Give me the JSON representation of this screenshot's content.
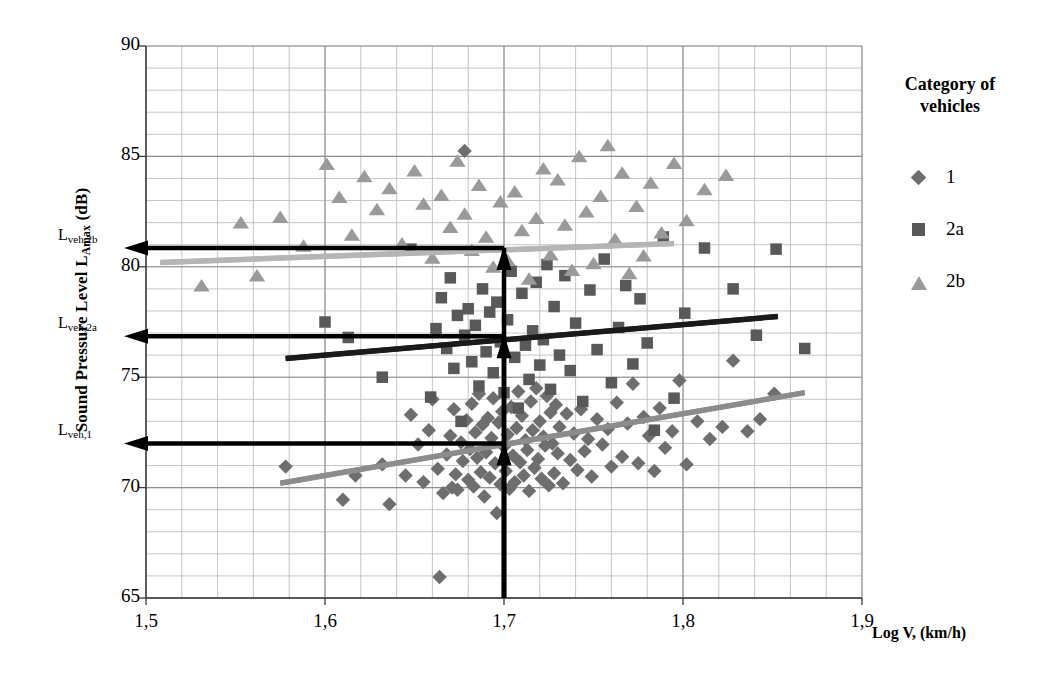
{
  "chart_data": {
    "type": "scatter",
    "title": "",
    "xlabel": "Log V, (km/h)",
    "ylabel": "Sound Pressure Level L_Amax (dB)",
    "ylabel_main": "Sound Pressure Level L",
    "ylabel_sub": "Amax",
    "ylabel_unit": " (dB)",
    "xlim": [
      1.5,
      1.9
    ],
    "ylim": [
      65,
      90
    ],
    "x_ticks": [
      "1,5",
      "1,6",
      "1,7",
      "1,8",
      "1,9"
    ],
    "x_tick_values": [
      1.5,
      1.6,
      1.7,
      1.8,
      1.9
    ],
    "y_ticks": [
      "65",
      "70",
      "75",
      "80",
      "85",
      "90"
    ],
    "y_tick_values": [
      65,
      70,
      75,
      80,
      85,
      90
    ],
    "grid": "major and minor, minor every 0.02 in x and 1 dB in y",
    "legend_position": "right",
    "legend_title_line1": "Category of",
    "legend_title_line2": "vehicles",
    "series": [
      {
        "name": "1",
        "marker": "diamond",
        "color": "#6e6e6e",
        "trend_color": "#8c8c8c",
        "trendline": {
          "x0": 1.575,
          "y0": 70.2,
          "x1": 1.868,
          "y1": 74.3
        },
        "points": [
          [
            1.578,
            70.95
          ],
          [
            1.61,
            69.45
          ],
          [
            1.617,
            70.55
          ],
          [
            1.632,
            71.05
          ],
          [
            1.636,
            69.25
          ],
          [
            1.645,
            70.55
          ],
          [
            1.648,
            73.3
          ],
          [
            1.652,
            71.95
          ],
          [
            1.655,
            70.25
          ],
          [
            1.658,
            72.6
          ],
          [
            1.66,
            74.0
          ],
          [
            1.663,
            70.85
          ],
          [
            1.664,
            65.95
          ],
          [
            1.666,
            69.75
          ],
          [
            1.668,
            71.5
          ],
          [
            1.67,
            72.35
          ],
          [
            1.671,
            70.0
          ],
          [
            1.672,
            73.55
          ],
          [
            1.673,
            70.6
          ],
          [
            1.674,
            69.9
          ],
          [
            1.676,
            72.05
          ],
          [
            1.677,
            71.2
          ],
          [
            1.678,
            85.25
          ],
          [
            1.679,
            73.05
          ],
          [
            1.68,
            70.35
          ],
          [
            1.681,
            71.75
          ],
          [
            1.682,
            73.8
          ],
          [
            1.683,
            70.05
          ],
          [
            1.684,
            72.5
          ],
          [
            1.685,
            71.35
          ],
          [
            1.686,
            74.25
          ],
          [
            1.687,
            70.7
          ],
          [
            1.688,
            72.85
          ],
          [
            1.689,
            69.6
          ],
          [
            1.69,
            71.6
          ],
          [
            1.691,
            73.15
          ],
          [
            1.692,
            70.45
          ],
          [
            1.693,
            72.25
          ],
          [
            1.694,
            74.05
          ],
          [
            1.695,
            71.1
          ],
          [
            1.696,
            68.85
          ],
          [
            1.697,
            72.95
          ],
          [
            1.698,
            70.15
          ],
          [
            1.699,
            73.45
          ],
          [
            1.7,
            71.85
          ],
          [
            1.701,
            70.75
          ],
          [
            1.702,
            72.4
          ],
          [
            1.703,
            69.95
          ],
          [
            1.704,
            73.65
          ],
          [
            1.705,
            71.45
          ],
          [
            1.706,
            70.25
          ],
          [
            1.707,
            72.7
          ],
          [
            1.708,
            74.35
          ],
          [
            1.709,
            71.15
          ],
          [
            1.71,
            73.25
          ],
          [
            1.711,
            70.55
          ],
          [
            1.712,
            72.15
          ],
          [
            1.713,
            71.7
          ],
          [
            1.714,
            69.85
          ],
          [
            1.715,
            73.9
          ],
          [
            1.716,
            72.6
          ],
          [
            1.717,
            70.9
          ],
          [
            1.718,
            74.5
          ],
          [
            1.719,
            71.3
          ],
          [
            1.72,
            73.0
          ],
          [
            1.721,
            70.4
          ],
          [
            1.722,
            72.3
          ],
          [
            1.723,
            71.9
          ],
          [
            1.724,
            74.15
          ],
          [
            1.725,
            70.1
          ],
          [
            1.726,
            73.4
          ],
          [
            1.727,
            72.0
          ],
          [
            1.728,
            70.65
          ],
          [
            1.729,
            73.75
          ],
          [
            1.73,
            71.55
          ],
          [
            1.731,
            72.75
          ],
          [
            1.733,
            70.2
          ],
          [
            1.735,
            73.35
          ],
          [
            1.737,
            71.25
          ],
          [
            1.739,
            72.45
          ],
          [
            1.741,
            70.8
          ],
          [
            1.743,
            73.55
          ],
          [
            1.745,
            71.65
          ],
          [
            1.747,
            72.2
          ],
          [
            1.749,
            70.5
          ],
          [
            1.752,
            73.1
          ],
          [
            1.755,
            71.95
          ],
          [
            1.758,
            72.65
          ],
          [
            1.76,
            70.95
          ],
          [
            1.763,
            73.85
          ],
          [
            1.766,
            71.4
          ],
          [
            1.769,
            72.9
          ],
          [
            1.772,
            74.7
          ],
          [
            1.775,
            71.1
          ],
          [
            1.778,
            73.2
          ],
          [
            1.781,
            72.35
          ],
          [
            1.784,
            70.75
          ],
          [
            1.787,
            73.6
          ],
          [
            1.79,
            71.8
          ],
          [
            1.794,
            72.55
          ],
          [
            1.798,
            74.85
          ],
          [
            1.802,
            71.05
          ],
          [
            1.808,
            73.0
          ],
          [
            1.815,
            72.2
          ],
          [
            1.822,
            72.75
          ],
          [
            1.828,
            75.75
          ],
          [
            1.836,
            72.55
          ],
          [
            1.843,
            73.1
          ],
          [
            1.851,
            74.25
          ]
        ]
      },
      {
        "name": "2a",
        "marker": "square",
        "color": "#595959",
        "trend_color": "#1a1a1a",
        "trendline": {
          "x0": 1.578,
          "y0": 75.85,
          "x1": 1.853,
          "y1": 77.75
        },
        "points": [
          [
            1.6,
            77.5
          ],
          [
            1.613,
            76.8
          ],
          [
            1.632,
            75.0
          ],
          [
            1.648,
            80.8
          ],
          [
            1.659,
            74.1
          ],
          [
            1.662,
            77.2
          ],
          [
            1.665,
            78.6
          ],
          [
            1.668,
            76.3
          ],
          [
            1.67,
            79.5
          ],
          [
            1.672,
            75.4
          ],
          [
            1.674,
            77.8
          ],
          [
            1.676,
            73.0
          ],
          [
            1.678,
            76.9
          ],
          [
            1.68,
            78.1
          ],
          [
            1.682,
            75.7
          ],
          [
            1.684,
            77.35
          ],
          [
            1.686,
            74.6
          ],
          [
            1.688,
            79.0
          ],
          [
            1.69,
            76.15
          ],
          [
            1.692,
            77.95
          ],
          [
            1.694,
            75.2
          ],
          [
            1.696,
            78.4
          ],
          [
            1.698,
            76.6
          ],
          [
            1.7,
            74.3
          ],
          [
            1.702,
            77.6
          ],
          [
            1.704,
            79.8
          ],
          [
            1.706,
            75.9
          ],
          [
            1.708,
            73.6
          ],
          [
            1.71,
            78.8
          ],
          [
            1.712,
            76.45
          ],
          [
            1.714,
            74.9
          ],
          [
            1.716,
            77.1
          ],
          [
            1.718,
            79.3
          ],
          [
            1.72,
            75.55
          ],
          [
            1.722,
            76.7
          ],
          [
            1.724,
            80.1
          ],
          [
            1.726,
            74.45
          ],
          [
            1.728,
            78.2
          ],
          [
            1.731,
            76.0
          ],
          [
            1.734,
            79.6
          ],
          [
            1.737,
            75.3
          ],
          [
            1.74,
            77.45
          ],
          [
            1.744,
            73.9
          ],
          [
            1.748,
            78.95
          ],
          [
            1.752,
            76.25
          ],
          [
            1.756,
            80.35
          ],
          [
            1.76,
            74.75
          ],
          [
            1.764,
            77.25
          ],
          [
            1.768,
            79.15
          ],
          [
            1.772,
            75.6
          ],
          [
            1.776,
            78.55
          ],
          [
            1.78,
            76.55
          ],
          [
            1.784,
            72.6
          ],
          [
            1.789,
            81.35
          ],
          [
            1.795,
            74.05
          ],
          [
            1.801,
            77.9
          ],
          [
            1.812,
            80.85
          ],
          [
            1.828,
            79.0
          ],
          [
            1.841,
            76.9
          ],
          [
            1.852,
            80.8
          ],
          [
            1.868,
            76.3
          ]
        ]
      },
      {
        "name": "2b",
        "marker": "triangle",
        "color": "#9a9a9a",
        "trend_color": "#b5b5b5",
        "trendline": {
          "x0": 1.508,
          "y0": 80.2,
          "x1": 1.795,
          "y1": 81.05
        },
        "points": [
          [
            1.531,
            79.1
          ],
          [
            1.553,
            81.95
          ],
          [
            1.562,
            79.55
          ],
          [
            1.575,
            82.2
          ],
          [
            1.588,
            80.9
          ],
          [
            1.601,
            84.6
          ],
          [
            1.608,
            83.1
          ],
          [
            1.615,
            81.4
          ],
          [
            1.622,
            84.05
          ],
          [
            1.629,
            82.55
          ],
          [
            1.636,
            83.5
          ],
          [
            1.643,
            81.0
          ],
          [
            1.65,
            84.3
          ],
          [
            1.655,
            82.8
          ],
          [
            1.66,
            80.35
          ],
          [
            1.665,
            83.2
          ],
          [
            1.67,
            81.75
          ],
          [
            1.674,
            84.75
          ],
          [
            1.678,
            82.35
          ],
          [
            1.682,
            80.7
          ],
          [
            1.686,
            83.65
          ],
          [
            1.69,
            81.3
          ],
          [
            1.694,
            79.95
          ],
          [
            1.698,
            82.9
          ],
          [
            1.702,
            80.25
          ],
          [
            1.706,
            83.35
          ],
          [
            1.71,
            81.6
          ],
          [
            1.714,
            79.4
          ],
          [
            1.718,
            82.15
          ],
          [
            1.722,
            84.4
          ],
          [
            1.726,
            80.5
          ],
          [
            1.73,
            83.9
          ],
          [
            1.734,
            81.85
          ],
          [
            1.738,
            79.8
          ],
          [
            1.742,
            84.95
          ],
          [
            1.746,
            82.45
          ],
          [
            1.75,
            80.1
          ],
          [
            1.754,
            83.15
          ],
          [
            1.758,
            85.45
          ],
          [
            1.762,
            81.2
          ],
          [
            1.766,
            84.2
          ],
          [
            1.77,
            79.65
          ],
          [
            1.774,
            82.7
          ],
          [
            1.778,
            80.45
          ],
          [
            1.782,
            83.75
          ],
          [
            1.788,
            81.5
          ],
          [
            1.795,
            84.65
          ],
          [
            1.802,
            82.05
          ],
          [
            1.812,
            83.45
          ],
          [
            1.824,
            84.1
          ]
        ]
      }
    ],
    "annotations": [
      {
        "name": "L_veh,2b",
        "label_main": "L",
        "label_sub": "veh,2b",
        "y_value": 80.85,
        "x_value": 1.7,
        "arrow": "horizontal-left + vertical-up"
      },
      {
        "name": "L_veh,2a",
        "label_main": "L",
        "label_sub": "veh,2a",
        "y_value": 76.85,
        "x_value": 1.7,
        "arrow": "horizontal-left + vertical-up"
      },
      {
        "name": "L_veh,1",
        "label_main": "L",
        "label_sub": "veh,1",
        "y_value": 72.0,
        "x_value": 1.7,
        "arrow": "horizontal-left + vertical-up"
      }
    ],
    "reference_x": 1.7,
    "grid_color": "#b8b8b8",
    "axis_color": "#555555",
    "annotation_color": "#000000"
  }
}
